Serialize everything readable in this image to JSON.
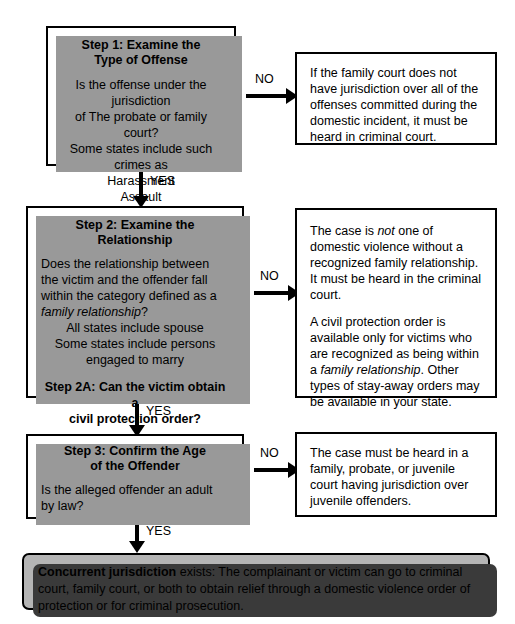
{
  "diagram": {
    "colors": {
      "ink": "#000000",
      "paper": "#ffffff",
      "box_shadow_gray": "#999999",
      "panel_fill": "#b5b5b5",
      "panel_shadow": "#3a3a3a"
    }
  },
  "steps": {
    "step1": {
      "title": "Step 1: Examine the\nType of Offense",
      "question": "Is the offense under the jurisdiction\nof The probate or family court?\nSome states include such crimes as",
      "examples": "Harassment\nAssault\nStalking",
      "no_label": "NO",
      "yes_label": "YES",
      "no_outcome": "If the family court does not have jurisdiction over all of the offenses committed during the domestic incident, it must be heard in criminal court."
    },
    "step2": {
      "title": "Step 2: Examine the Relationship",
      "question_pre": "Does the relationship between the victim and the offender fall within the category defined as a ",
      "question_italic": "family relationship",
      "question_post": "?",
      "details": "All states include spouse\nSome states include persons\nengaged to marry",
      "sub_title": "Step 2A: Can the victim obtain a\ncivil protection order?",
      "no_label": "NO",
      "yes_label": "YES",
      "no_outcome_p1_pre": "The case is ",
      "no_outcome_p1_italic": "not",
      "no_outcome_p1_post": " one of domestic violence without a recognized family relationship. It must be heard in the criminal court.",
      "no_outcome_p2_pre": "A civil protection order is available only for victims who are recognized as being within a ",
      "no_outcome_p2_italic": "family relationship",
      "no_outcome_p2_post": ". Other types of stay-away orders may be available in your state."
    },
    "step3": {
      "title": "Step 3: Confirm the Age\nof the Offender",
      "question": "Is the alleged offender an adult by law?",
      "no_label": "NO",
      "yes_label": "YES",
      "no_outcome": "The case must be heard in a family, probate, or juvenile court having jurisdiction over juvenile offenders."
    }
  },
  "conclusion": {
    "lead": "Concurrent jurisdiction",
    "text": " exists: The complainant or victim can go to criminal court, family court, or both to obtain relief through a domestic violence order of protection or for criminal prosecution."
  }
}
